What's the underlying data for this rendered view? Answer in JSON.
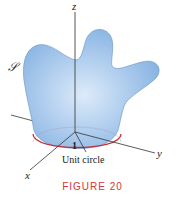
{
  "figure": {
    "caption": "FIGURE 20",
    "caption_color": "#d8333a",
    "surface_label": "𝒮",
    "surface_color": "#8fb8e4",
    "circle_color": "#c0303a",
    "axes": {
      "x_label": "x",
      "y_label": "y",
      "z_label": "z"
    },
    "radius_label": "1",
    "circle_label": "Unit circle"
  }
}
